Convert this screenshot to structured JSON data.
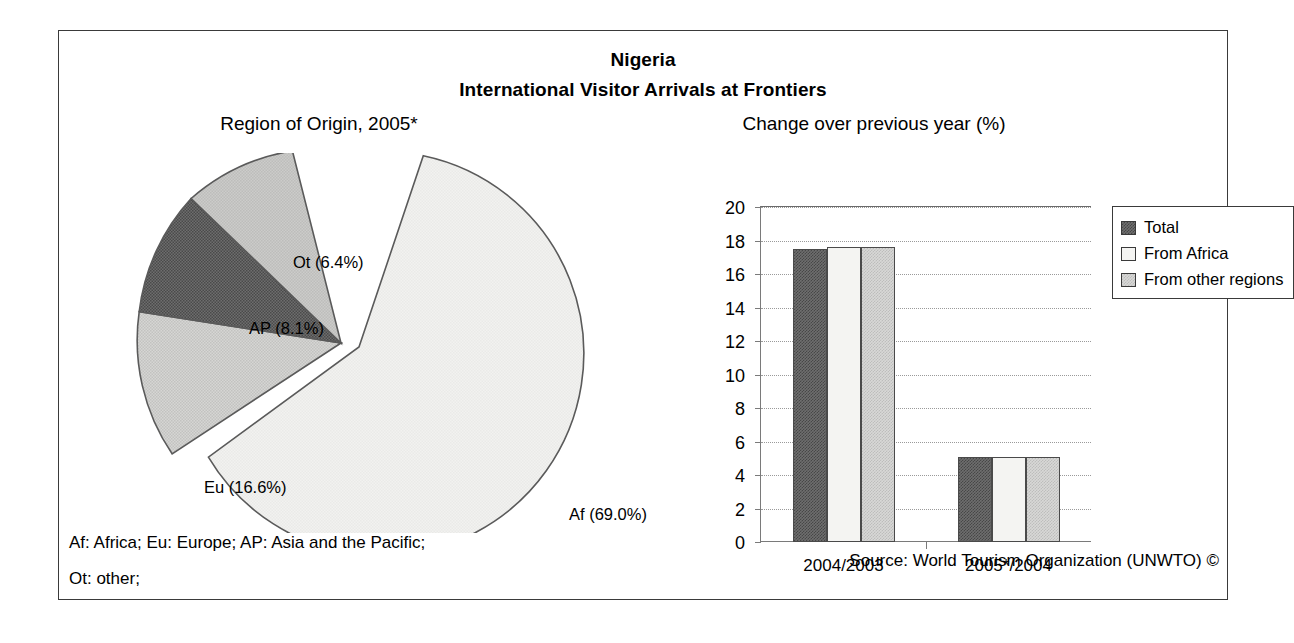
{
  "figure": {
    "title": "Nigeria",
    "subtitle": "International Visitor Arrivals at Frontiers",
    "footnote_line1": "Af: Africa; Eu: Europe; AP: Asia and the Pacific;",
    "footnote_line2": "Ot: other;",
    "source": "Source: World Tourism Organization (UNWTO) ©"
  },
  "chart_data": [
    {
      "type": "pie",
      "title": "Region of Origin, 2005*",
      "categories": [
        "Af",
        "Eu",
        "AP",
        "Ot"
      ],
      "values": [
        69.0,
        16.6,
        8.1,
        6.4
      ],
      "labels": [
        "Af (69.0%)",
        "Eu (16.6%)",
        "AP (8.1%)",
        "Ot (6.4%)"
      ],
      "colors": [
        "#f2f2f0",
        "#d2d2d0",
        "#6e6e6e",
        "#c6c6c4"
      ],
      "exploded_slice": "Af",
      "legend": "none",
      "unit": "%"
    },
    {
      "type": "bar",
      "title": "Change over previous year (%)",
      "categories": [
        "2004/2003",
        "2005*/2004"
      ],
      "series": [
        {
          "name": "Total",
          "values": [
            17.5,
            5.1
          ],
          "color": "#6e6e6e"
        },
        {
          "name": "From Africa",
          "values": [
            17.6,
            5.1
          ],
          "color": "#f4f4f2"
        },
        {
          "name": "From other regions",
          "values": [
            17.6,
            5.1
          ],
          "color": "#d8d8d6"
        }
      ],
      "xlabel": "",
      "ylabel": "",
      "ylim": [
        0,
        20
      ],
      "yticks": [
        0,
        2,
        4,
        6,
        8,
        10,
        12,
        14,
        16,
        18,
        20
      ],
      "grid": true,
      "legend_position": "right"
    }
  ]
}
